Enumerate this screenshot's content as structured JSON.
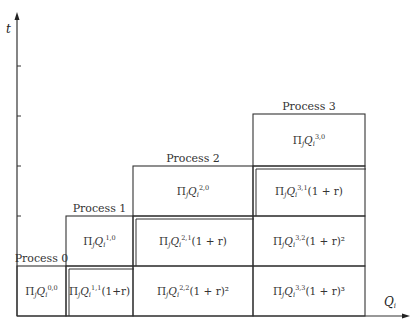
{
  "diagram": {
    "axes": {
      "y_label": "t",
      "x_label_main": "Q",
      "x_label_sub": "i",
      "y_ticks": 4
    },
    "processes": [
      {
        "label": "Process 0"
      },
      {
        "label": "Process 1"
      },
      {
        "label": "Process 2"
      },
      {
        "label": "Process 3"
      }
    ],
    "cells": [
      {
        "id": "c00",
        "col": 0,
        "row": 0,
        "base": "Π",
        "sub_j": "j",
        "Q": "Q",
        "sub_i": "i",
        "sup": "0,0",
        "tail": ""
      },
      {
        "id": "c10",
        "col": 1,
        "row": 1,
        "base": "Π",
        "sub_j": "j",
        "Q": "Q",
        "sub_i": "i",
        "sup": "1,0",
        "tail": ""
      },
      {
        "id": "c11",
        "col": 1,
        "row": 0,
        "base": "Π",
        "sub_j": "j",
        "Q": "Q",
        "sub_i": "i",
        "sup": "1,1",
        "tail": "(1+r)"
      },
      {
        "id": "c20",
        "col": 2,
        "row": 2,
        "base": "Π",
        "sub_j": "j",
        "Q": "Q",
        "sub_i": "i",
        "sup": "2,0",
        "tail": ""
      },
      {
        "id": "c21",
        "col": 2,
        "row": 1,
        "base": "Π",
        "sub_j": "j",
        "Q": "Q",
        "sub_i": "i",
        "sup": "2,1",
        "tail": "(1 + r)"
      },
      {
        "id": "c22",
        "col": 2,
        "row": 0,
        "base": "Π",
        "sub_j": "j",
        "Q": "Q",
        "sub_i": "i",
        "sup": "2,2",
        "tail": "(1 + r)²"
      },
      {
        "id": "c30",
        "col": 3,
        "row": 3,
        "base": "Π",
        "sub_j": "j",
        "Q": "Q",
        "sub_i": "i",
        "sup": "3,0",
        "tail": ""
      },
      {
        "id": "c31",
        "col": 3,
        "row": 2,
        "base": "Π",
        "sub_j": "j",
        "Q": "Q",
        "sub_i": "i",
        "sup": "3,1",
        "tail": "(1 + r)"
      },
      {
        "id": "c32",
        "col": 3,
        "row": 1,
        "base": "Π",
        "sub_j": "j",
        "Q": "Q",
        "sub_i": "i",
        "sup": "3,2",
        "tail": "(1 + r)²"
      },
      {
        "id": "c33",
        "col": 3,
        "row": 0,
        "base": "Π",
        "sub_j": "j",
        "Q": "Q",
        "sub_i": "i",
        "sup": "3,3",
        "tail": "(1 + r)³"
      }
    ]
  }
}
